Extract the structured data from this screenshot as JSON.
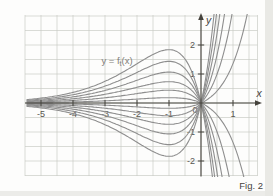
{
  "figure": {
    "caption": "Fig. 2"
  },
  "chart_data": {
    "type": "line",
    "title": "",
    "annotation": {
      "prefix": "y = f",
      "sub": "t",
      "suffix": "(x)"
    },
    "function_family": "f_t(x) = t * x * exp(x)",
    "t_values": [
      -5,
      -3.9,
      -2.9,
      -2,
      -1.2,
      -0.5,
      0.5,
      1.2,
      2,
      2.9,
      3.9,
      5
    ],
    "x_sample_range": [
      -5.45,
      1.85
    ],
    "xlim": [
      -5.5,
      1.78
    ],
    "ylim": [
      -2.5,
      3.05
    ],
    "grid_step": 0.5,
    "grid_on": true,
    "legend_position": "none",
    "x_ticks": [
      {
        "value": -5,
        "label": "-5"
      },
      {
        "value": -4,
        "label": "-4"
      },
      {
        "value": -3,
        "label": "-3"
      },
      {
        "value": -2,
        "label": "-2"
      },
      {
        "value": -1,
        "label": "-1"
      },
      {
        "value": 1,
        "label": "1"
      }
    ],
    "y_ticks": [
      {
        "value": 2,
        "label": "2"
      },
      {
        "value": 1,
        "label": "1"
      },
      {
        "value": -1,
        "label": "-1"
      },
      {
        "value": -2,
        "label": "-2"
      }
    ],
    "origin_label": "0",
    "axis_labels": {
      "x": "x",
      "y": "y"
    },
    "colors": {
      "curve": "#8e8e8e",
      "grid": "#c9cbc6",
      "axis": "#45423c",
      "tick_label": "#585650",
      "annotation": "#817e78",
      "caption": "#46433d",
      "background": "#fdfdfc"
    }
  }
}
